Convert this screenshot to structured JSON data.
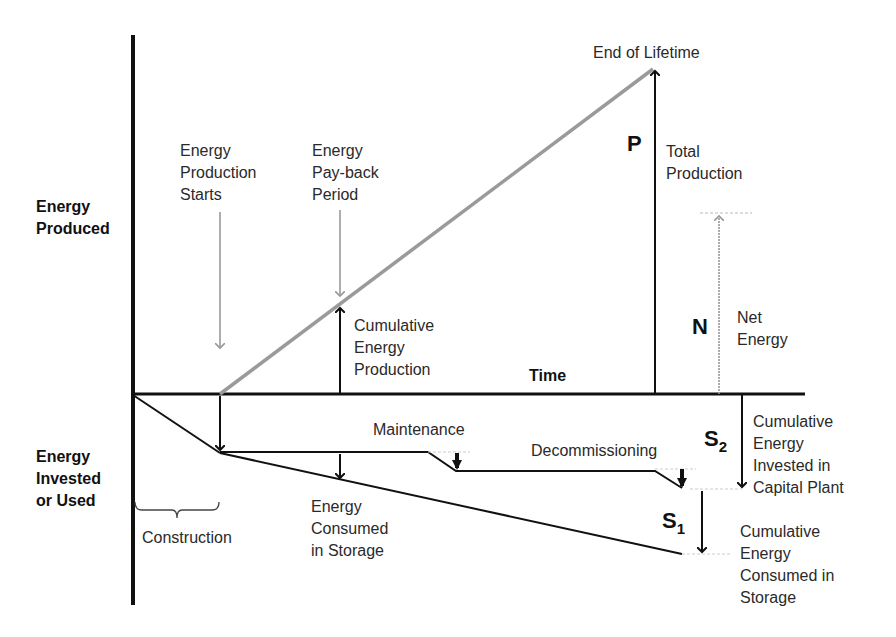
{
  "diagram": {
    "axis_labels": {
      "y_positive": "Energy\nProduced",
      "y_negative": "Energy\nInvested\nor Used",
      "x": "Time"
    },
    "events": {
      "production_starts": "Energy\nProduction\nStarts",
      "payback": "Energy\nPay-back\nPeriod",
      "end_of_lifetime": "End of Lifetime"
    },
    "quantities": {
      "cumulative_production": "Cumulative\nEnergy\nProduction",
      "P_symbol": "P",
      "P_label": "Total\nProduction",
      "N_symbol": "N",
      "N_label": "Net\nEnergy",
      "S2_symbol": "S",
      "S2_sub": "2",
      "S2_label": "Cumulative\nEnergy\nInvested in\nCapital Plant",
      "S1_symbol": "S",
      "S1_sub": "1",
      "S1_label": "Cumulative\nEnergy\nConsumed in\nStorage"
    },
    "phases": {
      "construction": "Construction",
      "maintenance": "Maintenance",
      "decommissioning": "Decommissioning",
      "storage": "Energy\nConsumed\nin Storage"
    },
    "colors": {
      "axis": "#111111",
      "production_line": "#9a9a9a",
      "annotation_arrow": "#999999",
      "text": "#2a2a2a"
    }
  }
}
